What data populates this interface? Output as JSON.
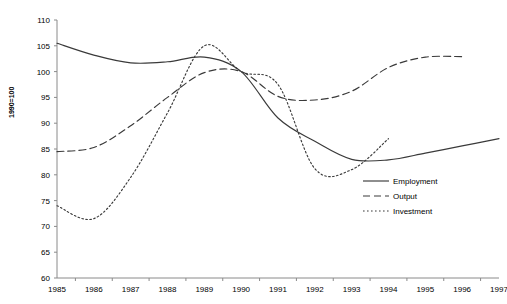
{
  "chart_data": {
    "type": "line",
    "title": "",
    "xlabel": "",
    "ylabel": "1990=100",
    "ylim": [
      60,
      110
    ],
    "ytick_step": 5,
    "yticks": [
      60,
      65,
      70,
      75,
      80,
      85,
      90,
      95,
      100,
      105,
      110
    ],
    "grid": false,
    "legend_position": "right-middle",
    "categories": [
      1985,
      1986,
      1987,
      1988,
      1989,
      1990,
      1991,
      1992,
      1993,
      1994,
      1995,
      1996,
      1997
    ],
    "xtick_labels": [
      "1985",
      "1986",
      "1987",
      "1988",
      "1989",
      "1990",
      "1991",
      "1992",
      "1993",
      "1994",
      "1995",
      "1996",
      "1997"
    ],
    "series": [
      {
        "name": "Employment",
        "style": "solid",
        "color": "#3a3a3a",
        "x": [
          1985,
          1986,
          1987,
          1988,
          1989,
          1990,
          1991,
          1992,
          1993,
          1994,
          1995,
          1996,
          1997
        ],
        "values": [
          105.5,
          103.2,
          101.7,
          101.9,
          102.8,
          100.0,
          91.0,
          86.5,
          83.0,
          82.9,
          84.2,
          85.6,
          87.0
        ]
      },
      {
        "name": "Output",
        "style": "dashed",
        "color": "#3a3a3a",
        "x": [
          1985,
          1986,
          1987,
          1988,
          1989,
          1990,
          1991,
          1992,
          1993,
          1994,
          1995,
          1996
        ],
        "values": [
          84.5,
          85.3,
          89.5,
          95.0,
          99.8,
          100.0,
          95.2,
          94.5,
          96.2,
          100.8,
          102.8,
          102.9
        ]
      },
      {
        "name": "Investment",
        "style": "dotted",
        "color": "#3a3a3a",
        "x": [
          1985,
          1986,
          1987,
          1988,
          1989,
          1990,
          1991,
          1992,
          1993,
          1994
        ],
        "values": [
          74.0,
          71.5,
          79.5,
          92.0,
          105.0,
          100.0,
          97.5,
          81.2,
          81.0,
          87.0
        ]
      }
    ],
    "legend": [
      {
        "label": "Employment",
        "style": "solid"
      },
      {
        "label": "Output",
        "style": "dashed"
      },
      {
        "label": "Investment",
        "style": "dotted"
      }
    ]
  }
}
